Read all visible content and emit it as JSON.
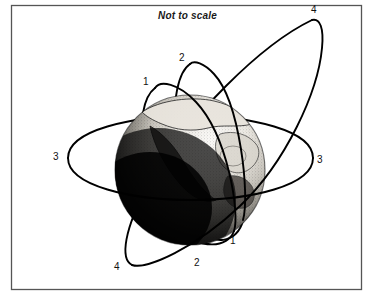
{
  "figure": {
    "note": "Not to scale",
    "border_color": "#555555",
    "line_color": "#000000",
    "background_color": "#ffffff",
    "frame": {
      "x": 11,
      "y": 5,
      "width": 351,
      "height": 285
    }
  },
  "earth": {
    "name": "earth-globe",
    "center_x": 190,
    "center_y": 170,
    "radius": 75,
    "dark_shade": "#111111",
    "light_shade": "#f2f0ec",
    "terminator_note": "dark lower-left limb, illuminated upper-right"
  },
  "orbits": [
    {
      "id": "1",
      "name": "orbit-1",
      "shape": "narrow inclined ellipse",
      "label_top": "1",
      "label_bottom": "1"
    },
    {
      "id": "2",
      "name": "orbit-2",
      "shape": "narrow inclined ellipse",
      "label_top": "2",
      "label_bottom": "2"
    },
    {
      "id": "3",
      "name": "orbit-3",
      "shape": "wide equatorial ellipse",
      "label_left": "3",
      "label_right": "3"
    },
    {
      "id": "4",
      "name": "orbit-4",
      "shape": "large eccentric inclined ellipse",
      "label_top": "4",
      "label_bottom": "4"
    }
  ],
  "labels": [
    {
      "text": "1",
      "name": "orbit-1-label-top",
      "x": 143,
      "y": 77
    },
    {
      "text": "2",
      "name": "orbit-2-label-top",
      "x": 179,
      "y": 53
    },
    {
      "text": "4",
      "name": "orbit-4-label-top",
      "x": 311,
      "y": 5
    },
    {
      "text": "3",
      "name": "orbit-3-label-left",
      "x": 53,
      "y": 152
    },
    {
      "text": "3",
      "name": "orbit-3-label-right",
      "x": 317,
      "y": 155
    },
    {
      "text": "1",
      "name": "orbit-1-label-bottom",
      "x": 230,
      "y": 236
    },
    {
      "text": "2",
      "name": "orbit-2-label-bottom",
      "x": 194,
      "y": 258
    },
    {
      "text": "4",
      "name": "orbit-4-label-bottom",
      "x": 114,
      "y": 262
    }
  ]
}
